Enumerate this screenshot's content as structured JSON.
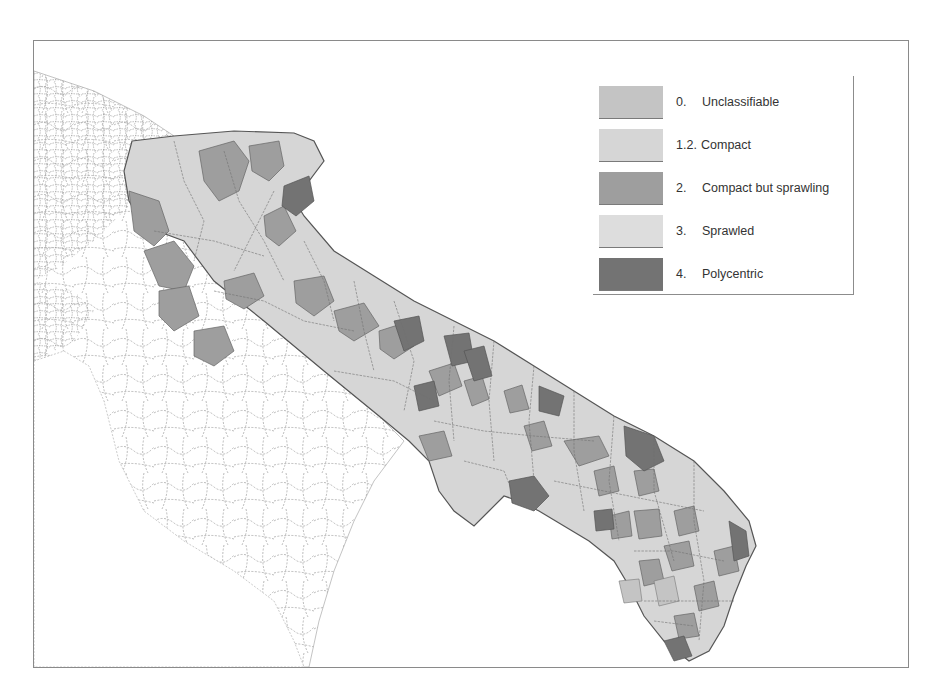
{
  "map": {
    "region": "Puglia (Apulia), southern Italy",
    "description": "Choropleth map of municipalities classified by urban form",
    "colors": {
      "sea": "#ffffff",
      "outside_region_fill": "#ffffff",
      "outside_region_border": "#9a9a9a",
      "region_border": "#555555"
    }
  },
  "legend": {
    "items": [
      {
        "num": "0.",
        "label": "Unclassifiable",
        "color": "#c4c4c4"
      },
      {
        "num": "1.2.",
        "label": "Compact",
        "color": "#d6d6d6"
      },
      {
        "num": "2.",
        "label": "Compact but sprawling",
        "color": "#9e9e9e"
      },
      {
        "num": "3.",
        "label": "Sprawled",
        "color": "#dddddd"
      },
      {
        "num": "4.",
        "label": "Polycentric",
        "color": "#737373"
      }
    ]
  }
}
